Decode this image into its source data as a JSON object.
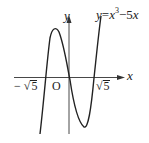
{
  "figure": {
    "equation": {
      "lhs": "y",
      "eq": "=",
      "x": "x",
      "exp": "3",
      "rest": "−5",
      "x2": "x"
    },
    "axes": {
      "x_label": "x",
      "y_label": "y",
      "origin_label": "O"
    },
    "roots": {
      "negative": {
        "sign": "−",
        "radical": "√",
        "radicand": "5"
      },
      "positive": {
        "radical": "√",
        "radicand": "5"
      }
    },
    "colors": {
      "stroke": "#222222",
      "background": "#ffffff"
    }
  }
}
